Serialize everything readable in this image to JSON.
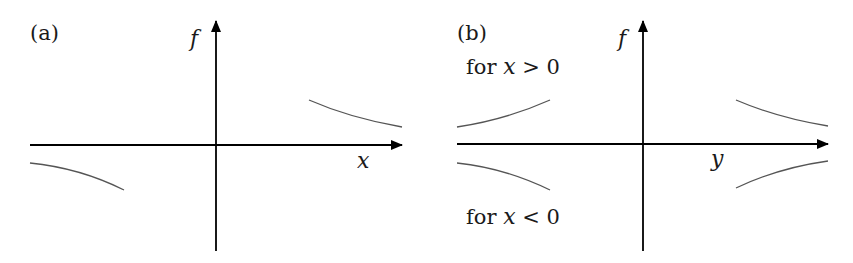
{
  "panels": [
    {
      "id": "a",
      "label": "(a)",
      "vertical_axis_label": "f",
      "horizontal_axis_label": "x",
      "annotations": []
    },
    {
      "id": "b",
      "label": "(b)",
      "vertical_axis_label": "f",
      "horizontal_axis_label": "y",
      "annotations": [
        {
          "prefix": "for ",
          "var": "x",
          "rel": " > 0"
        },
        {
          "prefix": "for ",
          "var": "x",
          "rel": " < 0"
        }
      ]
    }
  ],
  "colors": {
    "axis": "#000000",
    "curve": "#555555",
    "text": "#1a1a1a"
  }
}
